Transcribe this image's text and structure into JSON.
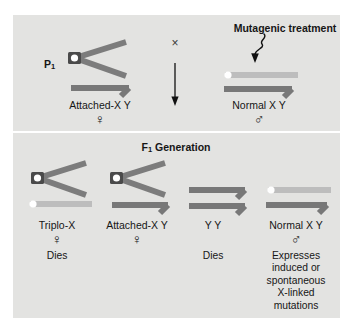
{
  "figure": {
    "background_color": "#ffffff",
    "panel_color": "#e3e3e1"
  },
  "colors": {
    "y_chromosome": "#787878",
    "x_chromosome_light": "#bdbdbd",
    "attached_x_arm": "#7c7c7c",
    "centromere_block": "#4a4a4a",
    "centromere_dot": "#ffffff",
    "text": "#161616",
    "arrow": "#111111"
  },
  "top_panel": {
    "generation_label": "P",
    "generation_subscript": "1",
    "cross_symbol": "×",
    "mutagen_label": "Mutagenic treatment",
    "mutagen_arrow_icon": "squiggly-arrow-down-left",
    "down_arrow_icon": "arrow-down",
    "parents": [
      {
        "id": "maternal",
        "karyotype_label": "Attached-X Y",
        "sex_symbol": "♀",
        "sex": "female",
        "chromosomes": [
          "attached-X",
          "Y"
        ]
      },
      {
        "id": "paternal",
        "karyotype_label": "Normal X Y",
        "sex_symbol": "♂",
        "sex": "male",
        "chromosomes": [
          "normal-X",
          "Y"
        ]
      }
    ]
  },
  "bottom_panel": {
    "heading": "F",
    "heading_subscript": "1",
    "heading_rest": " Generation",
    "offspring": [
      {
        "id": "triplo-x",
        "karyotype_label": "Triplo-X",
        "sex_symbol": "♀",
        "sex": "female",
        "fate": "Dies",
        "fate_lines": [
          "Dies"
        ],
        "chromosomes": [
          "attached-X",
          "normal-X"
        ]
      },
      {
        "id": "attached-x-y",
        "karyotype_label": "Attached-X Y",
        "sex_symbol": "♀",
        "sex": "female",
        "fate": "",
        "fate_lines": [],
        "chromosomes": [
          "attached-X",
          "Y"
        ]
      },
      {
        "id": "yy",
        "karyotype_label": "Y Y",
        "sex_symbol": "",
        "sex": "",
        "fate": "Dies",
        "fate_lines": [
          "Dies"
        ],
        "chromosomes": [
          "Y",
          "Y"
        ]
      },
      {
        "id": "normal-x-y",
        "karyotype_label": "Normal X Y",
        "sex_symbol": "♂",
        "sex": "male",
        "fate": "Expresses induced or spontaneous X-linked mutations",
        "fate_lines": [
          "Expresses",
          "induced or",
          "spontaneous",
          "X-linked",
          "mutations"
        ],
        "chromosomes": [
          "normal-X",
          "Y"
        ]
      }
    ]
  }
}
